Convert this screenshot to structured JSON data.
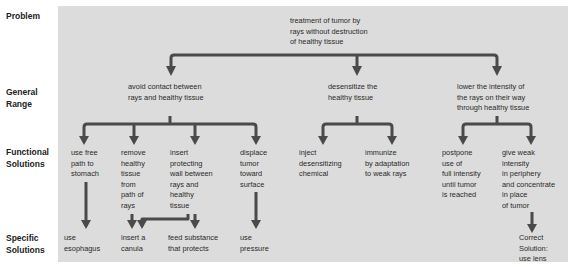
{
  "row_labels": {
    "problem": "Problem",
    "general_range": "General\nRange",
    "functional_solutions": "Functional\nSolutions",
    "specific_solutions": "Specific\nSolutions"
  },
  "problem": {
    "text": "treatment of tumor by\nrays without destruction\nof healthy tissue"
  },
  "general_range": [
    {
      "text": "avoid contact  between\nrays and healthy tissue"
    },
    {
      "text": "desensitize the\nhealthy tissue"
    },
    {
      "text": "lower the intensity of\nthe rays on their way\nthrough healthy tissue"
    }
  ],
  "functional_solutions": [
    {
      "text": "use free\npath to\nstomach"
    },
    {
      "text": "remove\nhealthy\ntissue\nfrom\npath of\nrays"
    },
    {
      "text": "insert\nprotecting\nwall between\nrays and\nhealthy\ntissue"
    },
    {
      "text": "displace\ntumor\ntoward\nsurface"
    },
    {
      "text": "inject\ndesensitizing\nchemical"
    },
    {
      "text": "immunize\nby adaptation\nto weak rays"
    },
    {
      "text": "postpone\nuse of\nfull intensity\nuntil tumor\nis reached"
    },
    {
      "text": "give weak\nintensity\nin periphery\nand concentrate\nin place\nof tumor"
    }
  ],
  "specific_solutions": [
    {
      "text": "use\nesophagus"
    },
    {
      "text": "insert a\ncanula"
    },
    {
      "text": "feed substance\nthat protects"
    },
    {
      "text": "use\npressure"
    },
    {
      "text": "Correct\nSolution:\nuse lens"
    }
  ],
  "colors": {
    "panel_background": "#dcdcdc",
    "arrow": "#4a4a4a",
    "text": "#2a2a2a"
  }
}
